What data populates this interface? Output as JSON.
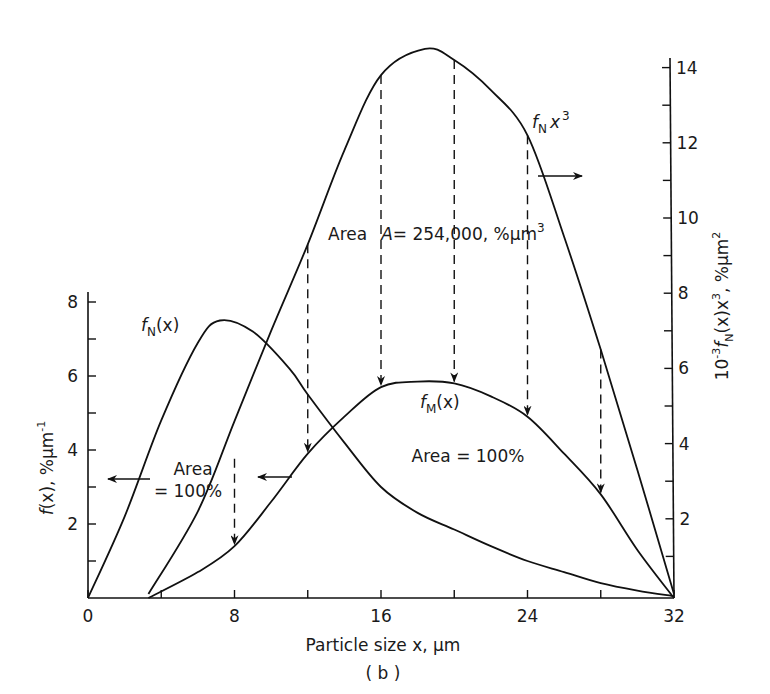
{
  "chart_data": {
    "type": "line",
    "title": "",
    "subtitle": "(b)",
    "xlabel": "Particle size x, µm",
    "ylabel_left": "f(x), %µm⁻¹",
    "ylabel_right": "10⁻³ fN(x) x³, %µm²",
    "xlim": [
      0,
      32
    ],
    "ylim_left": [
      0,
      8
    ],
    "ylim_right": [
      0,
      14
    ],
    "x_ticks": [
      0,
      4,
      8,
      12,
      16,
      20,
      24,
      28,
      32
    ],
    "x_tick_labels": [
      "0",
      "8",
      "16",
      "24",
      "32"
    ],
    "y_left_ticks": [
      1,
      2,
      3,
      4,
      5,
      6,
      7,
      8
    ],
    "y_left_tick_labels": [
      "2",
      "4",
      "6",
      "8"
    ],
    "y_right_ticks": [
      1,
      2,
      3,
      4,
      5,
      6,
      7,
      8,
      9,
      10,
      11,
      12,
      13,
      14
    ],
    "y_right_tick_labels": [
      "2",
      "4",
      "6",
      "8",
      "10",
      "12",
      "14"
    ],
    "grid": false,
    "legend": "inline labels",
    "series": [
      {
        "name": "fN(x)",
        "axis": "left",
        "x": [
          0,
          2,
          4,
          6,
          7.2,
          9,
          11,
          12,
          14,
          16,
          18,
          20,
          22,
          24,
          26,
          28,
          30,
          32
        ],
        "y": [
          0,
          2.2,
          4.8,
          6.9,
          7.5,
          7.2,
          6.2,
          5.5,
          4.2,
          3.0,
          2.3,
          1.85,
          1.4,
          1.0,
          0.7,
          0.4,
          0.2,
          0.05
        ],
        "annotation": "Area = 100%"
      },
      {
        "name": "fN x³",
        "axis": "right",
        "x": [
          3.3,
          6,
          8,
          10,
          12,
          14,
          16,
          18.4,
          20,
          22,
          24,
          26,
          28,
          30,
          32
        ],
        "y": [
          0,
          2.2,
          4.6,
          7.0,
          9.3,
          11.8,
          13.8,
          14.5,
          14.2,
          13.4,
          12.2,
          9.5,
          6.5,
          3.3,
          0
        ],
        "annotation": "Area A = 254,000, %µm³"
      },
      {
        "name": "fM(x)",
        "axis": "left",
        "x": [
          3.3,
          6,
          8,
          10,
          12,
          14,
          16,
          18,
          20,
          22,
          24,
          26,
          28,
          30,
          32
        ],
        "y": [
          0,
          0.7,
          1.4,
          2.6,
          3.9,
          4.9,
          5.7,
          5.85,
          5.8,
          5.45,
          4.9,
          3.9,
          2.8,
          1.3,
          0
        ],
        "annotation": "Area = 100%"
      }
    ],
    "projections": [
      {
        "x": 8,
        "from_right": 3.6,
        "to_left": 1.4
      },
      {
        "x": 12,
        "from_right": 9.3,
        "to_left": 3.9
      },
      {
        "x": 16,
        "from_right": 13.8,
        "to_left": 5.7
      },
      {
        "x": 20,
        "from_right": 14.2,
        "to_left": 5.8
      },
      {
        "x": 24,
        "from_right": 12.2,
        "to_left": 4.9
      },
      {
        "x": 28,
        "from_right": 6.5,
        "to_left": 2.8
      }
    ]
  },
  "labels": {
    "x_axis_title": "Particle size x, µm",
    "subtitle": "( b )",
    "fN_label_f": "f",
    "fN_label_sub": "N",
    "fN_label_rest": "(x)",
    "fM_label_f": "f",
    "fM_label_sub": "M",
    "fM_label_rest": "(x)",
    "fNx3_label_f": "f",
    "fNx3_label_sub": "N",
    "fNx3_label_rest": "x",
    "fNx3_label_sup": "3",
    "area_left_line1": "Area",
    "area_left_line2": "= 100%",
    "area_mid": "Area = 100%",
    "area_top_prefix": "Area",
    "area_top_A": "A",
    "area_top_value": "= 254,000, %µm",
    "area_top_sup": "3",
    "ylabel_left_f": "f",
    "ylabel_left_rest": "(x), %µm",
    "ylabel_left_sup": "-1",
    "ylabel_right_pre": "10",
    "ylabel_right_pre_sup": "-3",
    "ylabel_right_f": "f",
    "ylabel_right_sub": "N",
    "ylabel_right_mid": "(x)x",
    "ylabel_right_sup3": "3",
    "ylabel_right_rest": ", %µm",
    "ylabel_right_sup2": "2"
  }
}
